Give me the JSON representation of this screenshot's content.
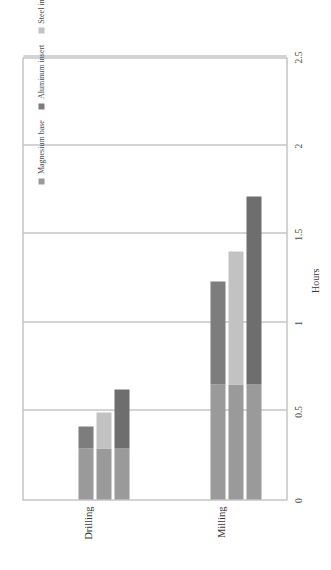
{
  "chart_data": {
    "type": "bar",
    "subtype": "stacked-bar",
    "orientation": "rotated-90",
    "title": "",
    "xlabel": "",
    "ylabel": "Hours",
    "ylim": [
      0,
      2.5
    ],
    "ytick_labels": [
      "0",
      "0.5",
      "1",
      "1.5",
      "2",
      "2.5"
    ],
    "ytick_values": [
      0,
      0.5,
      1,
      1.5,
      2,
      2.5
    ],
    "grid": true,
    "legend_position": "inside-top-right",
    "categories": [
      "Drilling",
      "Milling"
    ],
    "series": [
      {
        "name": "Magnesium base",
        "color": "#9a9a9a",
        "values": [
          0.29,
          0.65
        ]
      },
      {
        "name": "Aluminum insert",
        "color": "#7d7d7d",
        "values": [
          0.12,
          0.58
        ]
      },
      {
        "name": "Steel insert",
        "color": "#c2c2c2",
        "values": [
          0.2,
          0.75
        ]
      },
      {
        "name": "Titanium insert",
        "color": "#6e6e6e",
        "values": [
          0.33,
          1.06
        ]
      }
    ],
    "bars": [
      {
        "category": "Drilling",
        "stacks": [
          {
            "insert": "Aluminum insert",
            "base": 0.29,
            "top": 0.12,
            "total": 0.41
          },
          {
            "insert": "Steel insert",
            "base": 0.29,
            "top": 0.2,
            "total": 0.49
          },
          {
            "insert": "Titanium insert",
            "base": 0.29,
            "top": 0.33,
            "total": 0.62
          }
        ]
      },
      {
        "category": "Milling",
        "stacks": [
          {
            "insert": "Aluminum insert",
            "base": 0.65,
            "top": 0.58,
            "total": 1.23
          },
          {
            "insert": "Steel insert",
            "base": 0.65,
            "top": 0.75,
            "total": 1.4
          },
          {
            "insert": "Titanium insert",
            "base": 0.65,
            "top": 1.06,
            "total": 1.71
          }
        ]
      }
    ]
  },
  "axis": {
    "value_title": "Hours"
  },
  "legend": {
    "items": [
      {
        "label": "Magnesium base",
        "color": "#9a9a9a"
      },
      {
        "label": "Aluminum insert",
        "color": "#7d7d7d"
      },
      {
        "label": "Steel insert",
        "color": "#c2c2c2"
      },
      {
        "label": "Titanium insert",
        "color": "#6e6e6e"
      }
    ]
  },
  "colors": {
    "grid": "#a8a8a8",
    "axis_text": "#4a4a4a",
    "plot_border": "#a8a8a8",
    "background": "#ffffff"
  }
}
